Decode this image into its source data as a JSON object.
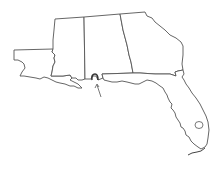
{
  "map": {
    "title": "",
    "region": "Southeastern United States",
    "states": [
      {
        "id": "louisiana",
        "label": ""
      },
      {
        "id": "mississippi",
        "label": ""
      },
      {
        "id": "alabama",
        "label": ""
      },
      {
        "id": "georgia",
        "label": ""
      },
      {
        "id": "florida",
        "label": ""
      }
    ],
    "highlight": {
      "id": "mobile-bay-area",
      "label": ""
    },
    "arrow": {
      "points_to": "mobile-bay-area"
    },
    "colors": {
      "outline": "#555555",
      "fill": "#ffffff",
      "background": "#ffffff"
    }
  }
}
